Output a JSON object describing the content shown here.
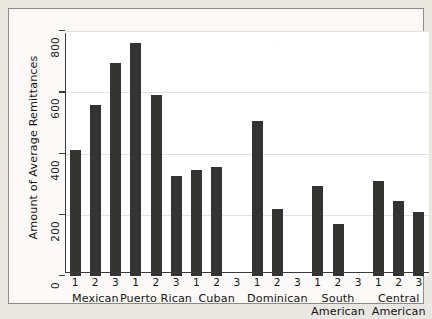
{
  "chart_data": {
    "type": "bar",
    "title": "",
    "xlabel": "",
    "ylabel": "Amount of Average Remittances",
    "ylim": [
      0,
      800
    ],
    "yticks": [
      0,
      200,
      400,
      600,
      800
    ],
    "ytick_labels": [
      "0",
      "200",
      "400",
      "600",
      "800"
    ],
    "grid": true,
    "legend": "none",
    "group_names": [
      "Mexican",
      "Puerto Rican",
      "Cuban",
      "Dominican",
      "South American",
      "Central American"
    ],
    "subcategories": [
      "1",
      "2",
      "3"
    ],
    "groups": [
      {
        "name": "Mexican",
        "name_line1": "Mexican",
        "name_line2": "",
        "bars": [
          {
            "label": "1",
            "value": 410
          },
          {
            "label": "2",
            "value": 560
          },
          {
            "label": "3",
            "value": 695
          }
        ]
      },
      {
        "name": "Puerto Rican",
        "name_line1": "Puerto Rican",
        "name_line2": "",
        "bars": [
          {
            "label": "1",
            "value": 760
          },
          {
            "label": "2",
            "value": 590
          },
          {
            "label": "3",
            "value": 325
          }
        ]
      },
      {
        "name": "Cuban",
        "name_line1": "Cuban",
        "name_line2": "",
        "bars": [
          {
            "label": "1",
            "value": 345
          },
          {
            "label": "2",
            "value": 355
          },
          {
            "label": "3",
            "value": null
          }
        ]
      },
      {
        "name": "Dominican",
        "name_line1": "Dominican",
        "name_line2": "",
        "bars": [
          {
            "label": "1",
            "value": 505
          },
          {
            "label": "2",
            "value": 220
          },
          {
            "label": "3",
            "value": null
          }
        ]
      },
      {
        "name": "South American",
        "name_line1": "South",
        "name_line2": "American",
        "bars": [
          {
            "label": "1",
            "value": 295
          },
          {
            "label": "2",
            "value": 170
          },
          {
            "label": "3",
            "value": null
          }
        ]
      },
      {
        "name": "Central American",
        "name_line1": "Central",
        "name_line2": "American",
        "bars": [
          {
            "label": "1",
            "value": 310
          },
          {
            "label": "2",
            "value": 245
          },
          {
            "label": "3",
            "value": 210
          }
        ]
      }
    ],
    "colors": {
      "bar": "#333331",
      "axis": "#3a3a38",
      "grid": "#e3e1dc",
      "plot_background": "#ffffff",
      "frame_background": "#fbfaf8",
      "page_background": "#e9e7e2",
      "text": "#151515"
    }
  }
}
